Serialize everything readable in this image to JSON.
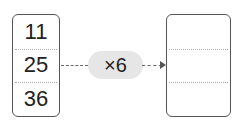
{
  "input_box": {
    "values": [
      "11",
      "25",
      "36"
    ]
  },
  "operation": {
    "label": "×6"
  },
  "output_box": {
    "values": [
      "",
      "",
      ""
    ]
  }
}
